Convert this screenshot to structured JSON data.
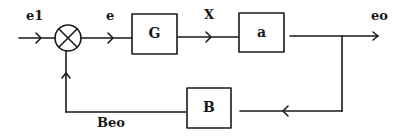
{
  "diagram": {
    "type": "feedback-control-block-diagram",
    "signals": {
      "input": "e1",
      "error": "e",
      "intermediate": "X",
      "output": "eo",
      "feedback": "Beo"
    },
    "blocks": [
      {
        "id": "G",
        "label": "G"
      },
      {
        "id": "a",
        "label": "a"
      },
      {
        "id": "B",
        "label": "B"
      }
    ],
    "summing_junction": {
      "label": ""
    },
    "colors": {
      "stroke": "#1a1a1a",
      "background": "#ffffff"
    }
  }
}
